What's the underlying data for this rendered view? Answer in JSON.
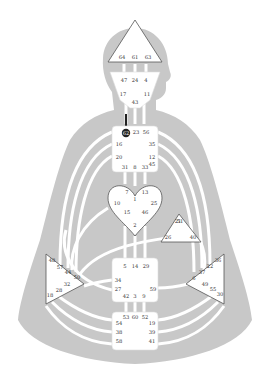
{
  "colors": {
    "background": "#ffffff",
    "silhouette": "#c8c8c8",
    "channel": "#ffffff",
    "center_fill": "#ffffff",
    "defined_outline": "#555555",
    "gate_text": "#333333",
    "active_gate_fill": "#222222",
    "active_gate_text": "#ffffff",
    "active_channel": "#222222"
  },
  "centers": {
    "head": {
      "name": "Head",
      "gates": [
        "64",
        "61",
        "63"
      ]
    },
    "ajna": {
      "name": "Ajna",
      "gates": [
        "47",
        "24",
        "4",
        "17",
        "11",
        "43"
      ]
    },
    "throat": {
      "name": "Throat",
      "gates": [
        "62",
        "23",
        "56",
        "16",
        "35",
        "20",
        "12",
        "45",
        "31",
        "8",
        "33"
      ]
    },
    "g": {
      "name": "G",
      "gates": [
        "7",
        "1",
        "13",
        "10",
        "25",
        "15",
        "46",
        "2"
      ]
    },
    "heart": {
      "name": "Heart",
      "gates": [
        "21",
        "51",
        "26",
        "40"
      ]
    },
    "spleen": {
      "name": "Spleen",
      "gates": [
        "48",
        "57",
        "44",
        "50",
        "32",
        "28",
        "18"
      ]
    },
    "sacral": {
      "name": "Sacral",
      "gates": [
        "5",
        "14",
        "29",
        "34",
        "27",
        "59",
        "42",
        "3",
        "9"
      ]
    },
    "solar_plexus": {
      "name": "Solar Plexus",
      "gates": [
        "36",
        "22",
        "37",
        "6",
        "49",
        "55",
        "30"
      ]
    },
    "root": {
      "name": "Root",
      "gates": [
        "53",
        "60",
        "52",
        "54",
        "19",
        "38",
        "39",
        "58",
        "41"
      ]
    }
  },
  "active_gates": [
    "62"
  ]
}
